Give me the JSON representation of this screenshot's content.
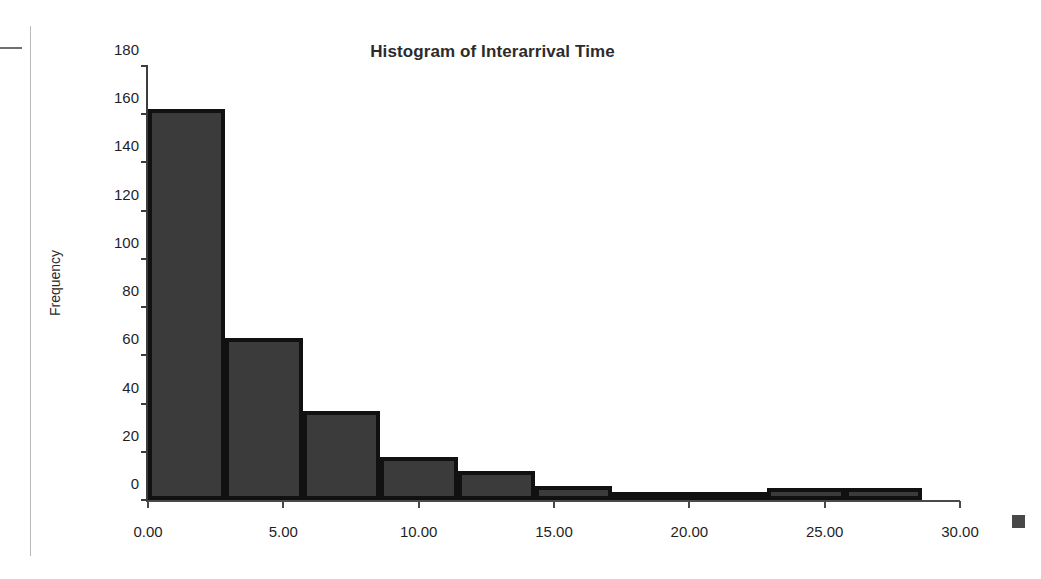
{
  "chart_data": {
    "type": "bar",
    "title": "Histogram of Interarrival Time",
    "xlabel": "",
    "ylabel": "Frequency",
    "xlim": [
      0,
      30
    ],
    "ylim": [
      0,
      180
    ],
    "grid": false,
    "legend_position": "right",
    "x_tick_labels": [
      "0.00",
      "5.00",
      "10.00",
      "15.00",
      "20.00",
      "25.00",
      "30.00"
    ],
    "x_tick_values": [
      0,
      5,
      10,
      15,
      20,
      25,
      30
    ],
    "y_tick_labels": [
      "0",
      "20",
      "40",
      "60",
      "80",
      "100",
      "120",
      "140",
      "160",
      "180"
    ],
    "y_tick_values": [
      0,
      20,
      40,
      60,
      80,
      100,
      120,
      140,
      160,
      180
    ],
    "bin_width": 2.86,
    "bin_edges": [
      0,
      2.86,
      5.72,
      8.58,
      11.44,
      14.3,
      17.16,
      20.02,
      22.88,
      25.74,
      28.6
    ],
    "bin_centers": [
      1.43,
      4.29,
      7.15,
      10.01,
      12.87,
      15.73,
      18.59,
      21.45,
      24.31,
      27.17
    ],
    "values": [
      162,
      67,
      37,
      18,
      12,
      6,
      3,
      3,
      5,
      5
    ],
    "bar_fill_color": "#3b3b3b",
    "bar_edge_color": "#111111",
    "axis_color": "#4a4a4a"
  },
  "legend": {
    "swatch_color": "#484848"
  }
}
